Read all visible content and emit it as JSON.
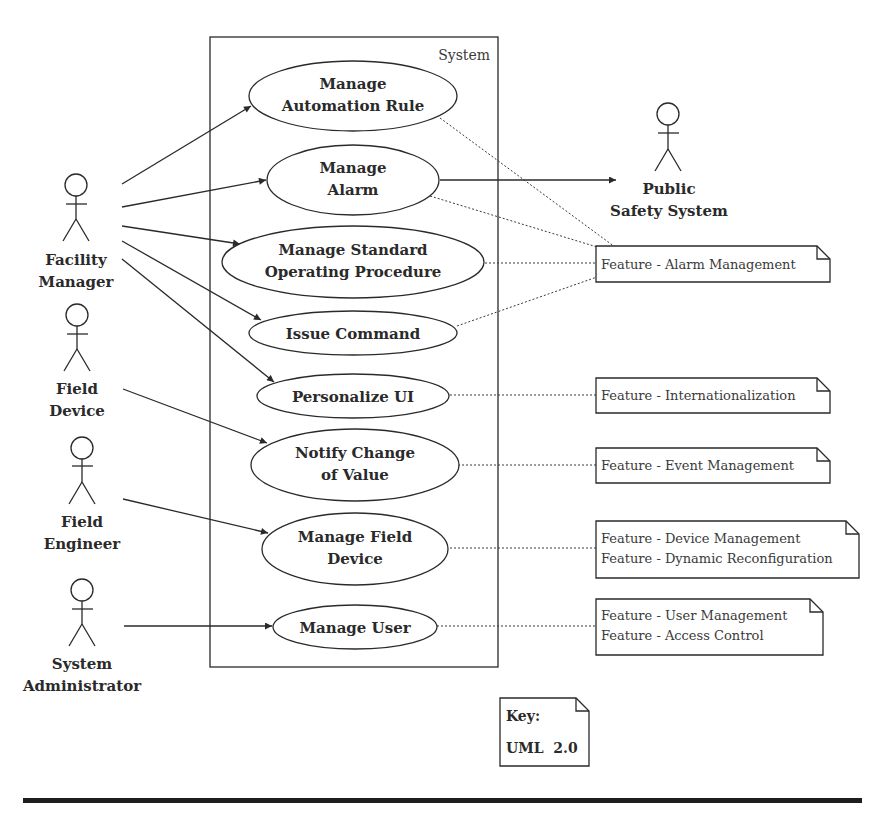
{
  "diagram": {
    "type": "UML use case diagram",
    "system_boundary": {
      "label": "System"
    },
    "actors": [
      {
        "id": "facility-manager",
        "label_lines": [
          "Facility",
          "Manager"
        ]
      },
      {
        "id": "field-device",
        "label_lines": [
          "Field",
          "Device"
        ]
      },
      {
        "id": "field-engineer",
        "label_lines": [
          "Field",
          "Engineer"
        ]
      },
      {
        "id": "system-administrator",
        "label_lines": [
          "System",
          "Administrator"
        ]
      },
      {
        "id": "public-safety-system",
        "label_lines": [
          "Public",
          "Safety System"
        ]
      }
    ],
    "use_cases": [
      {
        "id": "manage-automation-rule",
        "label_lines": [
          "Manage",
          "Automation Rule"
        ]
      },
      {
        "id": "manage-alarm",
        "label_lines": [
          "Manage",
          "Alarm"
        ]
      },
      {
        "id": "manage-sop",
        "label_lines": [
          "Manage Standard",
          "Operating Procedure"
        ]
      },
      {
        "id": "issue-command",
        "label_lines": [
          "Issue Command"
        ]
      },
      {
        "id": "personalize-ui",
        "label_lines": [
          "Personalize UI"
        ]
      },
      {
        "id": "notify-change-of-value",
        "label_lines": [
          "Notify Change",
          "of Value"
        ]
      },
      {
        "id": "manage-field-device",
        "label_lines": [
          "Manage Field",
          "Device"
        ]
      },
      {
        "id": "manage-user",
        "label_lines": [
          "Manage User"
        ]
      }
    ],
    "notes": [
      {
        "id": "note-alarm-management",
        "lines": [
          "Feature - Alarm Management"
        ]
      },
      {
        "id": "note-internationalization",
        "lines": [
          "Feature - Internationalization"
        ]
      },
      {
        "id": "note-event-management",
        "lines": [
          "Feature - Event Management"
        ]
      },
      {
        "id": "note-device",
        "lines": [
          "Feature - Device Management",
          "Feature - Dynamic Reconfiguration"
        ]
      },
      {
        "id": "note-user",
        "lines": [
          "Feature - User Management",
          "Feature - Access Control"
        ]
      }
    ],
    "associations": [
      {
        "from": "facility-manager",
        "to": "manage-automation-rule"
      },
      {
        "from": "facility-manager",
        "to": "manage-alarm"
      },
      {
        "from": "facility-manager",
        "to": "manage-sop"
      },
      {
        "from": "facility-manager",
        "to": "issue-command"
      },
      {
        "from": "facility-manager",
        "to": "personalize-ui"
      },
      {
        "from": "field-device",
        "to": "notify-change-of-value"
      },
      {
        "from": "field-engineer",
        "to": "manage-field-device"
      },
      {
        "from": "system-administrator",
        "to": "manage-user"
      },
      {
        "from": "manage-alarm",
        "to": "public-safety-system"
      }
    ],
    "traces": [
      {
        "from": "manage-automation-rule",
        "to": "note-alarm-management"
      },
      {
        "from": "manage-alarm",
        "to": "note-alarm-management"
      },
      {
        "from": "manage-sop",
        "to": "note-alarm-management"
      },
      {
        "from": "issue-command",
        "to": "note-alarm-management"
      },
      {
        "from": "personalize-ui",
        "to": "note-internationalization"
      },
      {
        "from": "notify-change-of-value",
        "to": "note-event-management"
      },
      {
        "from": "manage-field-device",
        "to": "note-device"
      },
      {
        "from": "manage-user",
        "to": "note-user"
      }
    ],
    "key": {
      "title": "Key:",
      "value": "UML  2.0"
    }
  }
}
